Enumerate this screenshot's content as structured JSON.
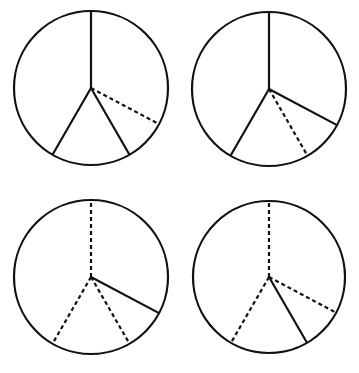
{
  "diagram": {
    "stroke_color": "#111111",
    "background": "#ffffff",
    "spoke_angles_deg": [
      -90,
      28,
      60,
      120
    ],
    "spoke_names": [
      "top",
      "right",
      "lower-right",
      "lower-left"
    ],
    "circles": [
      {
        "id": "circle-1",
        "cx": 91,
        "cy": 88,
        "r": 77,
        "spokes": [
          {
            "name": "top",
            "angle": -90,
            "style": "solid"
          },
          {
            "name": "right",
            "angle": 28,
            "style": "dashed"
          },
          {
            "name": "lower-right",
            "angle": 60,
            "style": "solid"
          },
          {
            "name": "lower-left",
            "angle": 120,
            "style": "solid"
          }
        ]
      },
      {
        "id": "circle-2",
        "cx": 269,
        "cy": 89,
        "r": 77,
        "spokes": [
          {
            "name": "top",
            "angle": -90,
            "style": "solid"
          },
          {
            "name": "right",
            "angle": 28,
            "style": "solid"
          },
          {
            "name": "lower-right",
            "angle": 60,
            "style": "dashed"
          },
          {
            "name": "lower-left",
            "angle": 120,
            "style": "solid"
          }
        ]
      },
      {
        "id": "circle-3",
        "cx": 91,
        "cy": 277,
        "r": 77,
        "spokes": [
          {
            "name": "top",
            "angle": -90,
            "style": "dashed"
          },
          {
            "name": "right",
            "angle": 28,
            "style": "solid"
          },
          {
            "name": "lower-right",
            "angle": 60,
            "style": "dashed"
          },
          {
            "name": "lower-left",
            "angle": 120,
            "style": "dashed"
          }
        ]
      },
      {
        "id": "circle-4",
        "cx": 269,
        "cy": 277,
        "r": 76,
        "spokes": [
          {
            "name": "top",
            "angle": -90,
            "style": "dashed"
          },
          {
            "name": "right",
            "angle": 28,
            "style": "dashed"
          },
          {
            "name": "lower-right",
            "angle": 60,
            "style": "solid"
          },
          {
            "name": "lower-left",
            "angle": 120,
            "style": "dashed"
          }
        ]
      }
    ]
  }
}
